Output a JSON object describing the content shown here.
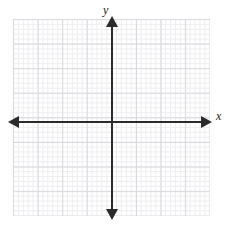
{
  "figure": {
    "kind": "cartesian-coordinate-plane",
    "width": 230,
    "height": 230,
    "background_color": "#ffffff"
  },
  "chart_data": {
    "type": "scatter",
    "title": "",
    "subtitle": "",
    "xlabel": "x",
    "ylabel": "y",
    "x": [],
    "y": [],
    "series": [],
    "annotations": [],
    "legend": null,
    "legend_position": "none",
    "grid": true,
    "grid_major_step": 1,
    "grid_minor_step": 0.2,
    "xlim": [
      -4,
      4
    ],
    "ylim": [
      -4,
      4
    ],
    "xticks": [],
    "yticks": [],
    "xtick_labels": [],
    "ytick_labels": [],
    "origin_label": "",
    "axis_color": "#2b2b2b",
    "grid_major_color": "#d8d8de",
    "grid_minor_color": "#ededf0"
  },
  "axes": {
    "x_label": "x",
    "y_label": "y",
    "origin_x": 112,
    "origin_y": 122
  },
  "grid": {
    "left": 13,
    "top": 19,
    "right": 210,
    "bottom": 216,
    "major_cell_px": 24.6,
    "minor_cell_px": 4.92
  }
}
